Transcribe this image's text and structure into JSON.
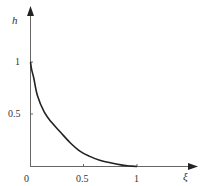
{
  "chart_data": {
    "type": "line",
    "title": "",
    "xlabel": "ξ",
    "ylabel": "h",
    "xlim": [
      0,
      1
    ],
    "ylim": [
      0,
      1
    ],
    "grid": false,
    "legend": null,
    "x_ticks": [
      "0.5",
      "1"
    ],
    "y_ticks": [
      "0.5",
      "1"
    ],
    "origin_label": "0",
    "series": [
      {
        "name": "h(ξ)",
        "color": "#222222",
        "x": [
          0.0,
          0.01,
          0.03,
          0.065,
          0.13,
          0.2,
          0.28,
          0.37,
          0.46,
          0.55,
          0.65,
          0.75,
          0.85,
          0.93,
          1.0
        ],
        "y": [
          1.0,
          0.93,
          0.85,
          0.68,
          0.52,
          0.42,
          0.33,
          0.23,
          0.15,
          0.1,
          0.06,
          0.035,
          0.015,
          0.005,
          0.0
        ]
      }
    ]
  },
  "labels": {
    "ylabel": "h",
    "xlabel": "ξ",
    "origin": "0",
    "x_tick_0_5": "0.5",
    "x_tick_1": "1",
    "y_tick_0_5": "0.5",
    "y_tick_1": "1"
  },
  "colors": {
    "axis": "#555555",
    "curve": "#222222",
    "text": "#333333"
  }
}
